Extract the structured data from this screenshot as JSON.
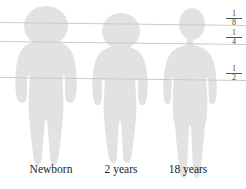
{
  "diagram": {
    "background_color": "#ffffff",
    "figure_fill": "#e2e2e2",
    "line_color": "#c9c9c9",
    "text_color": "#242424",
    "fraction_text_color": "#4a4a4a"
  },
  "reference_lines": [
    {
      "id": "line-one-eighth",
      "label_numerator": "1",
      "label_denominator": "8",
      "fraction": "1/8",
      "y_left": 22,
      "y_right": 25,
      "label_x": 226,
      "label_y": 14
    },
    {
      "id": "line-one-quarter",
      "label_numerator": "1",
      "label_denominator": "4",
      "fraction": "1/4",
      "y_left": 41,
      "y_right": 44,
      "label_x": 226,
      "label_y": 33
    },
    {
      "id": "line-one-half",
      "label_numerator": "1",
      "label_denominator": "2",
      "fraction": "1/2",
      "y_left": 77,
      "y_right": 80,
      "label_x": 226,
      "label_y": 69
    }
  ],
  "figures": [
    {
      "id": "figure-newborn",
      "caption": "Newborn",
      "caption_x": 14,
      "caption_y": 163,
      "caption_width": 74
    },
    {
      "id": "figure-2-years",
      "caption": "2 years",
      "caption_x": 88,
      "caption_y": 163,
      "caption_width": 66
    },
    {
      "id": "figure-18-years",
      "caption": "18 years",
      "caption_x": 152,
      "caption_y": 163,
      "caption_width": 72
    }
  ]
}
